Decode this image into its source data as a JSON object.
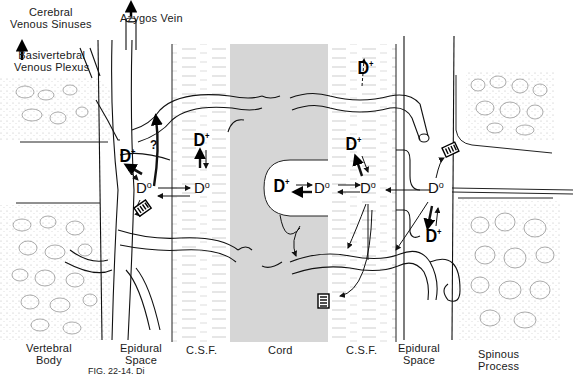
{
  "figure": {
    "caption_partial": "FIG. 22-14. Di",
    "regions": [
      {
        "id": "vertebral-body",
        "label": "Vertebral\nBody"
      },
      {
        "id": "epidural-left",
        "label": "Epidural\nSpace"
      },
      {
        "id": "csf-left",
        "label": "C.S.F."
      },
      {
        "id": "cord",
        "label": "Cord"
      },
      {
        "id": "csf-right",
        "label": "C.S.F."
      },
      {
        "id": "epidural-right",
        "label": "Epidural\nSpace"
      },
      {
        "id": "spinous-process",
        "label": "Spinous\nProcess"
      }
    ],
    "top_labels": {
      "cerebral_line1": "Cerebral",
      "cerebral_line2": "Venous Sinuses",
      "basivertebral_line1": "Basivertebral",
      "basivertebral_line2": "Venous Plexus",
      "azygos": "Azygos Vein"
    },
    "bottom_labels": {
      "vertebral_1": "Vertebral",
      "vertebral_2": "Body",
      "epidural_l_1": "Epidural",
      "epidural_l_2": "Space",
      "csf_l": "C.S.F.",
      "cord": "Cord",
      "csf_r": "C.S.F.",
      "epidural_r_1": "Epidural",
      "epidural_r_2": "Space",
      "spinous_1": "Spinous",
      "spinous_2": "Process"
    },
    "species": {
      "ionized": "D",
      "ionized_sup": "+",
      "unionized": "D",
      "unionized_sup": "o",
      "question": "?"
    },
    "colors": {
      "cord_fill": "#d6d6d6",
      "bone_stipple": "#9a9a9a",
      "line": "#111111",
      "background": "#ffffff"
    }
  }
}
